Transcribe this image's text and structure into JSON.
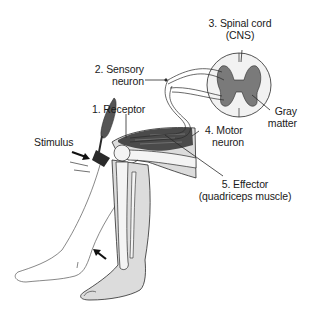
{
  "diagram": {
    "labels": {
      "spinal_cord_line1": "3. Spinal cord",
      "spinal_cord_line2": "(CNS)",
      "sensory_line1": "2. Sensory",
      "sensory_line2": "neuron",
      "receptor": "1. Receptor",
      "gray_line1": "Gray",
      "gray_line2": "matter",
      "stimulus": "Stimulus",
      "motor_line1": "4. Motor",
      "motor_line2": "neuron",
      "effector_line1": "5. Effector",
      "effector_line2": "(quadriceps muscle)"
    },
    "colors": {
      "background": "#ffffff",
      "outline": "#2a2a2a",
      "skin_fill": "#dcdcdc",
      "gray_matter": "#7a7a7a",
      "white_matter": "#f2f2f2",
      "muscle_dark": "#4a4a4a",
      "hammer": "#3a3a3a"
    }
  }
}
